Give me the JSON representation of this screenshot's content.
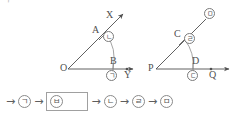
{
  "page": {
    "corner_mark": "ᄀ",
    "background_color": "#ffffff",
    "ink_color": "#4f4f4f"
  },
  "figures": {
    "left_angle": {
      "name": "angle-XOY",
      "vertex_label": "O",
      "ray_up_label": "X",
      "ray_right_label": "Y",
      "point_on_ray_up": "A",
      "point_on_ray_right": "B",
      "arc_marker_near_up": "ⓛ",
      "arc_marker_near_right": "ⓖ",
      "marker_near_up_text": "ㄴ",
      "marker_near_right_text": "ㄱ"
    },
    "right_angle": {
      "name": "angle-at-P",
      "vertex_label": "P",
      "ray_right_label": "Q",
      "point_on_ray_up": "C",
      "point_on_ray_right": "D",
      "marker_ray_up_end_text": "ㅁ",
      "marker_near_C_text": "ㄹ",
      "marker_near_D_text": "ㄷ"
    }
  },
  "flow": {
    "name": "construction-step-sequence",
    "steps": [
      {
        "kind": "arrow",
        "label": "→"
      },
      {
        "kind": "circle",
        "label": "ㄱ"
      },
      {
        "kind": "arrow",
        "label": "→"
      },
      {
        "kind": "box",
        "label": "ㅂ"
      },
      {
        "kind": "arrow",
        "label": "→"
      },
      {
        "kind": "circle",
        "label": "ㄴ"
      },
      {
        "kind": "arrow",
        "label": "→"
      },
      {
        "kind": "circle",
        "label": "ㄹ"
      },
      {
        "kind": "arrow",
        "label": "→"
      },
      {
        "kind": "circle",
        "label": "ㅁ"
      }
    ]
  }
}
